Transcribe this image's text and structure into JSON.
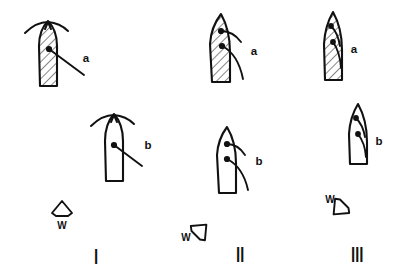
{
  "figure": {
    "title": "",
    "background_color": "#ffffff",
    "ink_color": "#111111",
    "width": 397,
    "height": 275
  },
  "panels": [
    {
      "id": "panel-1",
      "numeral": "Ⅰ",
      "numeral_name": "roman-one",
      "wind": {
        "label": "W",
        "direction": "up",
        "arrow_rotation_deg": 0,
        "description": "wind arrow pointing up"
      },
      "rows": [
        {
          "id": "row-a",
          "label": "a",
          "shape_fill": "hatched",
          "sail_state": "upright-symmetric",
          "node_count": 1,
          "description": "hatched upright hull with symmetric arched spar over the top and one batten to lower right"
        },
        {
          "id": "row-b",
          "label": "b",
          "shape_fill": "outline",
          "sail_state": "upright-symmetric",
          "node_count": 1,
          "description": "open outline hull with symmetric arched spar over the top and one batten to lower right"
        }
      ]
    },
    {
      "id": "panel-2",
      "numeral": "Ⅱ",
      "numeral_name": "roman-two",
      "wind": {
        "label": "W",
        "direction": "upper-right",
        "arrow_rotation_deg": 45,
        "description": "wind arrow pointing up and to the right"
      },
      "rows": [
        {
          "id": "row-a",
          "label": "a",
          "shape_fill": "hatched",
          "sail_state": "leaning-right",
          "node_count": 2,
          "description": "hatched hull leaning, two nodes with battens curving out to the right"
        },
        {
          "id": "row-b",
          "label": "b",
          "shape_fill": "outline",
          "sail_state": "leaning-right",
          "node_count": 2,
          "description": "open outline hull leaning, two nodes with battens curving out to the right"
        }
      ]
    },
    {
      "id": "panel-3",
      "numeral": "Ⅲ",
      "numeral_name": "roman-three",
      "wind": {
        "label": "W",
        "direction": "lower-left",
        "arrow_rotation_deg": 225,
        "description": "wind arrow pointing down and to the left"
      },
      "rows": [
        {
          "id": "row-a",
          "label": "a",
          "shape_fill": "hatched",
          "sail_state": "furled-inward",
          "node_count": 2,
          "description": "narrow hatched hull with battens folded inside the outline"
        },
        {
          "id": "row-b",
          "label": "b",
          "shape_fill": "outline",
          "sail_state": "furled-inward",
          "node_count": 2,
          "description": "narrow open outline hull with battens folded inside the outline"
        }
      ]
    }
  ]
}
